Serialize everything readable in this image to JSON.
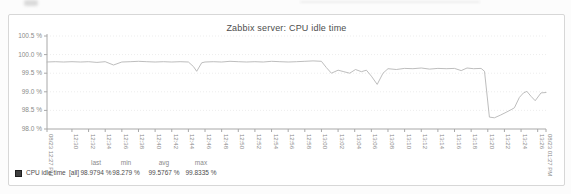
{
  "page": {
    "background": "#fcfcfc",
    "panel_border": "#d7d7d7"
  },
  "chart_data": {
    "type": "line",
    "title": "Zabbix server: CPU idle time",
    "xlabel": "",
    "ylabel": "",
    "ylim": [
      98.0,
      100.5
    ],
    "x_range_minutes": [
      0,
      60
    ],
    "grid": true,
    "legend_position": "bottom",
    "axis_color": "#a8a8a8",
    "grid_color": "#ededed",
    "tick_label_color": "#8a8a8a",
    "yticks": [
      {
        "v": 100.5,
        "label": "100.5 %"
      },
      {
        "v": 100.0,
        "label": "100.0 %"
      },
      {
        "v": 99.5,
        "label": "99.5 %"
      },
      {
        "v": 99.0,
        "label": "99.0 %"
      },
      {
        "v": 98.5,
        "label": "98.5 %"
      },
      {
        "v": 98.0,
        "label": "98.0 %"
      }
    ],
    "xticks": [
      {
        "m": 3,
        "label": "12:30"
      },
      {
        "m": 5,
        "label": "12:32"
      },
      {
        "m": 7,
        "label": "12:34"
      },
      {
        "m": 9,
        "label": "12:36"
      },
      {
        "m": 11,
        "label": "12:38"
      },
      {
        "m": 13,
        "label": "12:40"
      },
      {
        "m": 15,
        "label": "12:42"
      },
      {
        "m": 17,
        "label": "12:44"
      },
      {
        "m": 19,
        "label": "12:46"
      },
      {
        "m": 21,
        "label": "12:48"
      },
      {
        "m": 23,
        "label": "12:50"
      },
      {
        "m": 25,
        "label": "12:52"
      },
      {
        "m": 27,
        "label": "12:54"
      },
      {
        "m": 29,
        "label": "12:56"
      },
      {
        "m": 31,
        "label": "12:58"
      },
      {
        "m": 33,
        "label": "13:00"
      },
      {
        "m": 35,
        "label": "13:02"
      },
      {
        "m": 37,
        "label": "13:04"
      },
      {
        "m": 39,
        "label": "13:06"
      },
      {
        "m": 41,
        "label": "13:08"
      },
      {
        "m": 43,
        "label": "13:10"
      },
      {
        "m": 45,
        "label": "13:12"
      },
      {
        "m": 47,
        "label": "13:14"
      },
      {
        "m": 49,
        "label": "13:16"
      },
      {
        "m": 51,
        "label": "13:18"
      },
      {
        "m": 53,
        "label": "13:20"
      },
      {
        "m": 55,
        "label": "13:22"
      },
      {
        "m": 57,
        "label": "13:24"
      },
      {
        "m": 59,
        "label": "13:26"
      }
    ],
    "x_boundary_labels": [
      {
        "m": 0,
        "label": "08/23 12:27 PM"
      },
      {
        "m": 60,
        "label": "08/23 01:27 PM"
      }
    ],
    "series": [
      {
        "name": "CPU idle time",
        "color": "#b5b5b5",
        "points": [
          [
            0,
            99.8
          ],
          [
            1,
            99.81
          ],
          [
            2,
            99.8
          ],
          [
            3,
            99.81
          ],
          [
            4,
            99.8
          ],
          [
            5,
            99.81
          ],
          [
            6,
            99.79
          ],
          [
            7,
            99.81
          ],
          [
            8,
            99.72
          ],
          [
            9,
            99.8
          ],
          [
            10,
            99.81
          ],
          [
            11,
            99.82
          ],
          [
            12,
            99.81
          ],
          [
            13,
            99.8
          ],
          [
            14,
            99.81
          ],
          [
            15,
            99.8
          ],
          [
            16,
            99.81
          ],
          [
            17,
            99.8
          ],
          [
            17.6,
            99.68
          ],
          [
            18,
            99.55
          ],
          [
            18.6,
            99.78
          ],
          [
            19,
            99.8
          ],
          [
            20,
            99.81
          ],
          [
            21,
            99.8
          ],
          [
            22,
            99.82
          ],
          [
            23,
            99.81
          ],
          [
            24,
            99.8
          ],
          [
            25,
            99.81
          ],
          [
            26,
            99.8
          ],
          [
            27,
            99.82
          ],
          [
            28,
            99.81
          ],
          [
            29,
            99.8
          ],
          [
            30,
            99.81
          ],
          [
            31,
            99.82
          ],
          [
            32,
            99.83
          ],
          [
            33,
            99.82
          ],
          [
            33.6,
            99.65
          ],
          [
            34.2,
            99.5
          ],
          [
            35,
            99.58
          ],
          [
            35.7,
            99.54
          ],
          [
            36.4,
            99.5
          ],
          [
            37.1,
            99.6
          ],
          [
            37.8,
            99.54
          ],
          [
            38.4,
            99.58
          ],
          [
            39,
            99.42
          ],
          [
            39.7,
            99.2
          ],
          [
            40.4,
            99.5
          ],
          [
            41,
            99.62
          ],
          [
            42,
            99.6
          ],
          [
            43,
            99.63
          ],
          [
            44,
            99.62
          ],
          [
            45,
            99.64
          ],
          [
            46,
            99.61
          ],
          [
            47,
            99.63
          ],
          [
            48,
            99.62
          ],
          [
            49,
            99.63
          ],
          [
            49.8,
            99.57
          ],
          [
            50.5,
            99.64
          ],
          [
            51.3,
            99.62
          ],
          [
            52.2,
            99.63
          ],
          [
            52.6,
            99.55
          ],
          [
            53.2,
            98.32
          ],
          [
            53.8,
            98.3
          ],
          [
            54.5,
            98.37
          ],
          [
            55.2,
            98.45
          ],
          [
            55.8,
            98.52
          ],
          [
            56.2,
            98.57
          ],
          [
            56.8,
            98.85
          ],
          [
            57.3,
            98.97
          ],
          [
            57.7,
            99.01
          ],
          [
            58.2,
            98.88
          ],
          [
            58.7,
            98.76
          ],
          [
            59.4,
            98.97
          ],
          [
            60,
            98.98
          ]
        ]
      }
    ],
    "legend": {
      "swatch_color": "#3f3f3f",
      "name": "CPU idle time",
      "scope": "[all]",
      "stats": [
        {
          "header": "last",
          "value": "98.9794 %"
        },
        {
          "header": "min",
          "value": "98.279 %"
        },
        {
          "header": "avg",
          "value": "99.5767 %"
        },
        {
          "header": "max",
          "value": "99.8335 %"
        }
      ]
    }
  }
}
